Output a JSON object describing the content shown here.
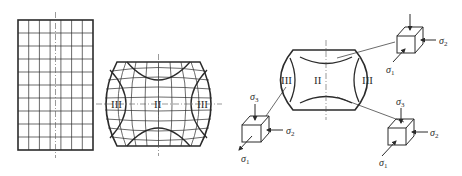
{
  "figure": {
    "panels": [
      {
        "id": "undeformed-grid",
        "description": "Rectangular coordinate grid before deformation"
      },
      {
        "id": "deformed-grid",
        "description": "Barrel-shaped deformed grid after upsetting"
      },
      {
        "id": "stress-zones",
        "description": "Deformation zones with stress states"
      }
    ],
    "zone_labels": {
      "zone1": "I",
      "zone2": "II",
      "zone3": "III"
    },
    "deformed_grid_labels": {
      "left": "III",
      "center": "II",
      "right": "III"
    },
    "body_labels": {
      "left": "III",
      "center": "II",
      "right": "III"
    },
    "stress_symbols": {
      "s1": "σ",
      "s1_sub": "1",
      "s2": "σ",
      "s2_sub": "2",
      "s3": "σ",
      "s3_sub": "3"
    },
    "cubes": [
      {
        "id": "top-right",
        "labels": [
          "σ1",
          "σ2"
        ],
        "zone": "III"
      },
      {
        "id": "bottom-left",
        "labels": [
          "σ3",
          "σ2",
          "σ1"
        ],
        "zone": "III"
      },
      {
        "id": "bottom-right",
        "labels": [
          "σ3",
          "σ2",
          "σ1"
        ],
        "zone": "II"
      }
    ]
  }
}
